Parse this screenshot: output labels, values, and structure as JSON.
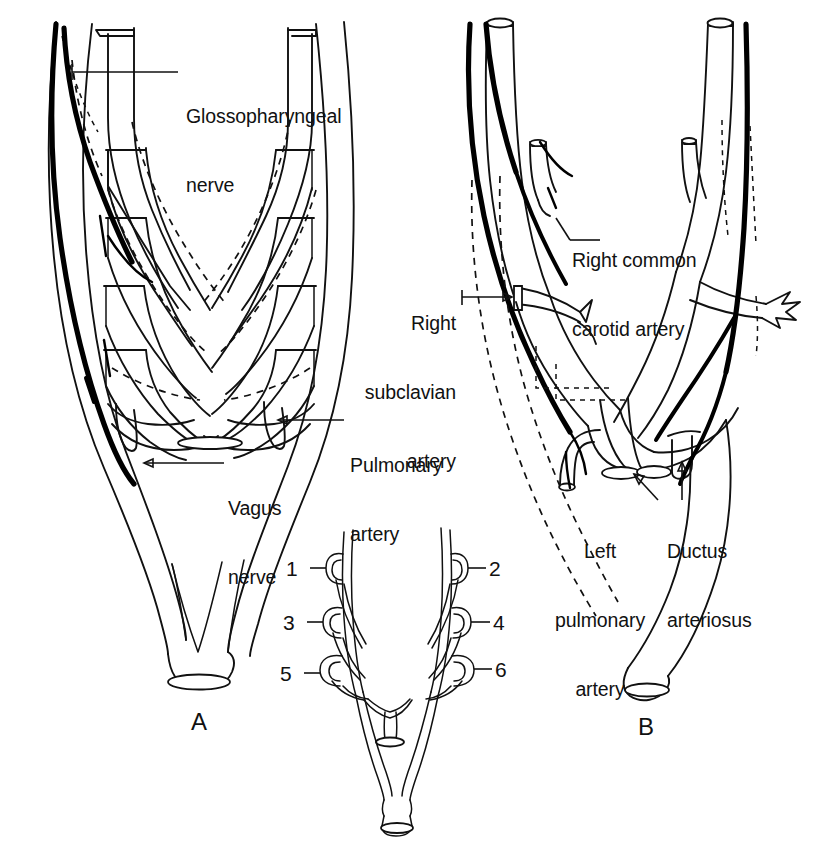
{
  "figure": {
    "type": "anatomical-line-diagram",
    "background_color": "#ffffff",
    "ink_color": "#111111"
  },
  "panels": [
    {
      "id": "A",
      "letter": "A",
      "description": "Primitive aortic arch system with six pairs of pharyngeal arch arteries, dorsal aortae and the glossopharyngeal and vagus nerves",
      "labels": [
        {
          "name": "glossopharyngeal-nerve",
          "line1": "Glossopharyngeal",
          "line2": "nerve"
        },
        {
          "name": "vagus-nerve",
          "line1": "Vagus",
          "line2": "nerve"
        },
        {
          "name": "pulmonary-artery",
          "line1": "Pulmonary",
          "line2": "artery"
        }
      ]
    },
    {
      "id": "B",
      "letter": "B",
      "description": "Definitive adult derivative pattern of the aortic arches with the recurrent laryngeal nerves hooking around the subclavian artery and ductus arteriosus",
      "labels": [
        {
          "name": "right-common-carotid-artery",
          "line1": "Right common",
          "line2": "carotid artery"
        },
        {
          "name": "right-subclavian-artery",
          "line1": "Right",
          "line2": "subclavian",
          "line3": "artery"
        },
        {
          "name": "left-pulmonary-artery",
          "line1": "Left",
          "line2": "pulmonary",
          "line3": "artery"
        },
        {
          "name": "ductus-arteriosus",
          "line1": "Ductus",
          "line2": "arteriosus"
        }
      ]
    },
    {
      "id": "C",
      "letter": "",
      "description": "Small key diagram of the six pharyngeal arch arteries numbered 1 to 6",
      "numbers": [
        "1",
        "2",
        "3",
        "4",
        "5",
        "6"
      ]
    }
  ],
  "labels_flat": {
    "glossopharyngeal_l1": "Glossopharyngeal",
    "glossopharyngeal_l2": "nerve",
    "vagus_l1": "Vagus",
    "vagus_l2": "nerve",
    "pulmonary_l1": "Pulmonary",
    "pulmonary_l2": "artery",
    "rcc_l1": "Right common",
    "rcc_l2": "carotid artery",
    "rsa_l1": "Right",
    "rsa_l2": "subclavian",
    "rsa_l3": "artery",
    "lpa_l1": "Left",
    "lpa_l2": "pulmonary",
    "lpa_l3": "artery",
    "ductus_l1": "Ductus",
    "ductus_l2": "arteriosus",
    "panel_a": "A",
    "panel_b": "B",
    "n1": "1",
    "n2": "2",
    "n3": "3",
    "n4": "4",
    "n5": "5",
    "n6": "6"
  }
}
